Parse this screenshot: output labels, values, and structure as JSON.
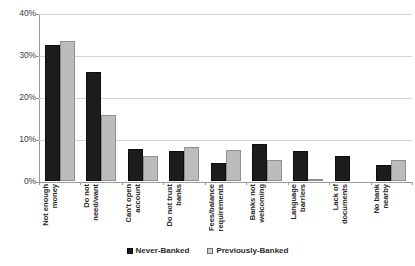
{
  "chart_data": {
    "type": "bar",
    "title": "",
    "subtitle": "",
    "xlabel": "",
    "ylabel": "",
    "ylim": [
      0,
      40
    ],
    "ytick_labels": [
      "0%",
      "10%",
      "20%",
      "30%",
      "40%"
    ],
    "ytick_values": [
      0,
      10,
      20,
      30,
      40
    ],
    "grid": true,
    "legend_position": "bottom",
    "categories": [
      "Not enough money",
      "Do not need/want",
      "Can't open account",
      "Do not trust banks",
      "Fees/balance requirements",
      "Banks not welcoming",
      "Language barriers",
      "Lack of documents",
      "No bank nearby"
    ],
    "series": [
      {
        "name": "Never-Banked",
        "color": "#1c1c1c",
        "values": [
          32.5,
          26.0,
          7.7,
          7.2,
          4.2,
          8.8,
          7.2,
          6.0,
          3.7
        ]
      },
      {
        "name": "Previously-Banked",
        "color": "#bcbcbc",
        "values": [
          33.4,
          15.7,
          6.0,
          8.2,
          7.5,
          5.0,
          0.4,
          0.0,
          5.0
        ]
      }
    ]
  },
  "legend": {
    "items": [
      {
        "label": "Never-Banked",
        "swatch": "dark"
      },
      {
        "label": "Previously-Banked",
        "swatch": "light"
      }
    ]
  }
}
